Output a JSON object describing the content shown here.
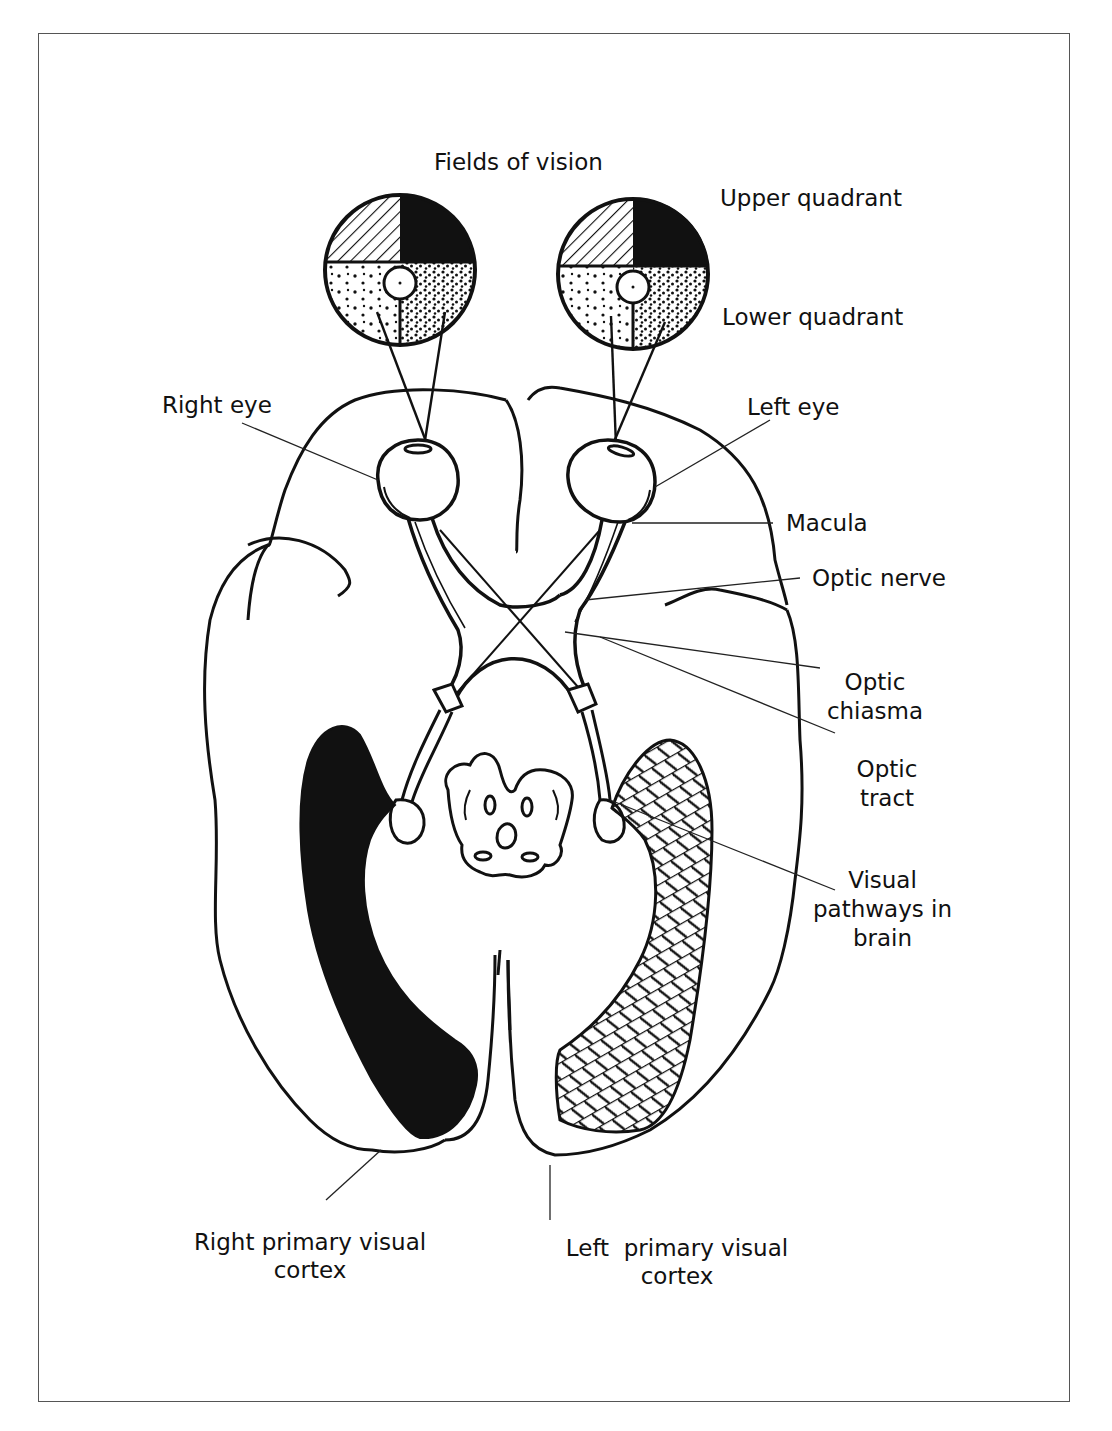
{
  "figure": {
    "title": "Fields of vision",
    "quadrant_labels": {
      "upper": "Upper quadrant",
      "lower": "Lower quadrant"
    },
    "labels": {
      "right_eye": "Right eye",
      "left_eye": "Left eye",
      "macula": "Macula",
      "optic_nerve": "Optic nerve",
      "optic_chiasma_line1": "Optic",
      "optic_chiasma_line2": "chiasma",
      "optic_tract_line1": "Optic",
      "optic_tract_line2": "tract",
      "visual_pathways_line1": "Visual",
      "visual_pathways_line2": "pathways in",
      "visual_pathways_line3": "brain",
      "right_cortex_line1": "Right primary visual",
      "right_cortex_line2": "cortex",
      "left_cortex_line1": "Left  primary visual",
      "left_cortex_line2": "cortex"
    },
    "colors": {
      "ink": "#111111",
      "frame": "#555555",
      "background": "#ffffff"
    }
  }
}
